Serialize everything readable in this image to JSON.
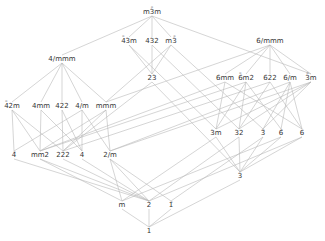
{
  "nodes": [
    {
      "id": "m-3m",
      "label": "m3̄m",
      "x": 152,
      "y": 12
    },
    {
      "id": "-43m",
      "label": "4̄3m",
      "x": 129,
      "y": 41
    },
    {
      "id": "432",
      "label": "432",
      "x": 152,
      "y": 41
    },
    {
      "id": "m-3",
      "label": "m3̄",
      "x": 171,
      "y": 41
    },
    {
      "id": "6/mmm",
      "label": "6/mmm",
      "x": 270,
      "y": 41
    },
    {
      "id": "4/mmm",
      "label": "4/mmm",
      "x": 62,
      "y": 59
    },
    {
      "id": "23",
      "label": "23",
      "x": 152,
      "y": 78
    },
    {
      "id": "6mm",
      "label": "6mm",
      "x": 225,
      "y": 78
    },
    {
      "id": "-6m2",
      "label": "6̄m2",
      "x": 246,
      "y": 78
    },
    {
      "id": "622",
      "label": "622",
      "x": 270,
      "y": 78
    },
    {
      "id": "6/m",
      "label": "6/m",
      "x": 290,
      "y": 78
    },
    {
      "id": "-3m",
      "label": "3̄m",
      "x": 311,
      "y": 78
    },
    {
      "id": "-42m",
      "label": "4̄2m",
      "x": 12,
      "y": 106
    },
    {
      "id": "4mm",
      "label": "4mm",
      "x": 41,
      "y": 106
    },
    {
      "id": "422",
      "label": "422",
      "x": 62,
      "y": 106
    },
    {
      "id": "4/m",
      "label": "4/m",
      "x": 82,
      "y": 106
    },
    {
      "id": "mmm",
      "label": "mmm",
      "x": 106,
      "y": 106
    },
    {
      "id": "3m",
      "label": "3m",
      "x": 216,
      "y": 133
    },
    {
      "id": "32",
      "label": "32",
      "x": 239,
      "y": 133
    },
    {
      "id": "-3",
      "label": "3̄",
      "x": 263,
      "y": 133
    },
    {
      "id": "-6",
      "label": "6̄",
      "x": 281,
      "y": 133
    },
    {
      "id": "6",
      "label": "6",
      "x": 302,
      "y": 133
    },
    {
      "id": "-4",
      "label": "4̄",
      "x": 14,
      "y": 155
    },
    {
      "id": "mm2",
      "label": "mm2",
      "x": 40,
      "y": 155
    },
    {
      "id": "222",
      "label": "222",
      "x": 63,
      "y": 155
    },
    {
      "id": "4",
      "label": "4",
      "x": 82,
      "y": 155
    },
    {
      "id": "2/m",
      "label": "2/m",
      "x": 110,
      "y": 155
    },
    {
      "id": "3",
      "label": "3",
      "x": 240,
      "y": 176
    },
    {
      "id": "m",
      "label": "m",
      "x": 122,
      "y": 205
    },
    {
      "id": "2",
      "label": "2",
      "x": 149,
      "y": 205
    },
    {
      "id": "-1",
      "label": "1̄",
      "x": 171,
      "y": 205
    },
    {
      "id": "1",
      "label": "1",
      "x": 149,
      "y": 231
    }
  ],
  "edges": [
    [
      "m-3m",
      "-43m"
    ],
    [
      "m-3m",
      "432"
    ],
    [
      "m-3m",
      "m-3"
    ],
    [
      "m-3m",
      "4/mmm"
    ],
    [
      "m-3m",
      "-3m"
    ],
    [
      "-43m",
      "23"
    ],
    [
      "-43m",
      "3m"
    ],
    [
      "432",
      "23"
    ],
    [
      "432",
      "32"
    ],
    [
      "m-3",
      "23"
    ],
    [
      "m-3",
      "-3"
    ],
    [
      "m-3",
      "mmm"
    ],
    [
      "4/mmm",
      "-42m"
    ],
    [
      "4/mmm",
      "4mm"
    ],
    [
      "4/mmm",
      "422"
    ],
    [
      "4/mmm",
      "4/m"
    ],
    [
      "4/mmm",
      "mmm"
    ],
    [
      "6/mmm",
      "6mm"
    ],
    [
      "6/mmm",
      "-6m2"
    ],
    [
      "6/mmm",
      "622"
    ],
    [
      "6/mmm",
      "6/m"
    ],
    [
      "6/mmm",
      "-3m"
    ],
    [
      "6/mmm",
      "mmm"
    ],
    [
      "23",
      "222"
    ],
    [
      "23",
      "3"
    ],
    [
      "6mm",
      "3m"
    ],
    [
      "6mm",
      "6"
    ],
    [
      "6mm",
      "mm2"
    ],
    [
      "-6m2",
      "3m"
    ],
    [
      "-6m2",
      "32"
    ],
    [
      "-6m2",
      "-6"
    ],
    [
      "-6m2",
      "mm2"
    ],
    [
      "622",
      "32"
    ],
    [
      "622",
      "6"
    ],
    [
      "622",
      "222"
    ],
    [
      "6/m",
      "-3"
    ],
    [
      "6/m",
      "-6"
    ],
    [
      "6/m",
      "6"
    ],
    [
      "6/m",
      "2/m"
    ],
    [
      "-3m",
      "3m"
    ],
    [
      "-3m",
      "32"
    ],
    [
      "-3m",
      "-3"
    ],
    [
      "-3m",
      "2/m"
    ],
    [
      "-42m",
      "-4"
    ],
    [
      "-42m",
      "mm2"
    ],
    [
      "-42m",
      "222"
    ],
    [
      "4mm",
      "mm2"
    ],
    [
      "4mm",
      "4"
    ],
    [
      "422",
      "222"
    ],
    [
      "422",
      "4"
    ],
    [
      "4/m",
      "-4"
    ],
    [
      "4/m",
      "4"
    ],
    [
      "4/m",
      "2/m"
    ],
    [
      "mmm",
      "mm2"
    ],
    [
      "mmm",
      "222"
    ],
    [
      "mmm",
      "2/m"
    ],
    [
      "3m",
      "3"
    ],
    [
      "3m",
      "m"
    ],
    [
      "32",
      "3"
    ],
    [
      "32",
      "2"
    ],
    [
      "-3",
      "3"
    ],
    [
      "-3",
      "-1"
    ],
    [
      "-6",
      "3"
    ],
    [
      "-6",
      "m"
    ],
    [
      "6",
      "3"
    ],
    [
      "6",
      "2"
    ],
    [
      "-4",
      "2"
    ],
    [
      "mm2",
      "m"
    ],
    [
      "mm2",
      "2"
    ],
    [
      "222",
      "2"
    ],
    [
      "4",
      "2"
    ],
    [
      "2/m",
      "m"
    ],
    [
      "2/m",
      "2"
    ],
    [
      "2/m",
      "-1"
    ],
    [
      "3",
      "1"
    ],
    [
      "m",
      "1"
    ],
    [
      "2",
      "1"
    ],
    [
      "-1",
      "1"
    ]
  ]
}
